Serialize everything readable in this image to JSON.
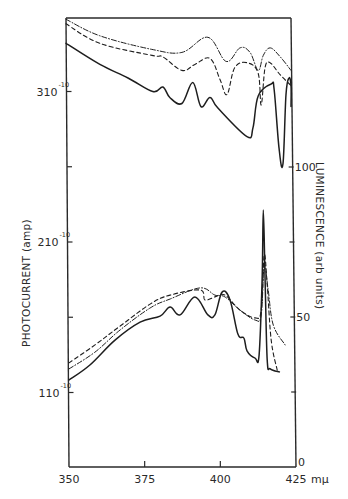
{
  "chart_data": {
    "type": "line",
    "title": "",
    "xlabel": "",
    "x_unit": "mμ",
    "ylabel_left": "PHOTOCURRENT (amp)",
    "ylabel_right": "LUMINESCENCE (arb units)",
    "xlim": [
      350,
      425
    ],
    "x_ticks": [
      {
        "value": 350,
        "label": "350"
      },
      {
        "value": 375,
        "label": "375"
      },
      {
        "value": 400,
        "label": "400"
      },
      {
        "value": 425,
        "label": "425"
      }
    ],
    "y_left_ticks": [
      {
        "value": 3.0,
        "mantissa": "3",
        "base": "10",
        "exp": "-10",
        "labeled": true
      },
      {
        "value": 2.5,
        "labeled": false
      },
      {
        "value": 2.0,
        "mantissa": "2",
        "base": "10",
        "exp": "-10",
        "labeled": true
      },
      {
        "value": 1.5,
        "labeled": false
      },
      {
        "value": 1.0,
        "mantissa": "1",
        "base": "10",
        "exp": "-10",
        "labeled": true
      }
    ],
    "y_left_unit_note": "values in units of 1e-10 A",
    "y_right_ticks": [
      {
        "value": 100,
        "label": "100"
      },
      {
        "value": 75,
        "label": ""
      },
      {
        "value": 50,
        "label": "50"
      },
      {
        "value": 25,
        "label": ""
      },
      {
        "value": 0,
        "label": "0"
      }
    ],
    "ylim_right": [
      0,
      100
    ],
    "grid": false,
    "legend": null,
    "series": [
      {
        "name": "photocurrent-solid",
        "axis": "left",
        "style": "solid",
        "x": [
          349.0,
          360.2,
          369.5,
          377.7,
          381.0,
          383.3,
          387.3,
          390.9,
          393.6,
          396.6,
          399.2,
          408.8,
          410.8,
          412.5,
          416.8,
          417.8,
          419.4,
          420.7,
          421.7,
          422.7,
          425.3,
          430.0
        ],
        "y": [
          3.32,
          3.18,
          3.09,
          3.0,
          3.03,
          2.96,
          2.92,
          3.06,
          2.9,
          2.96,
          2.89,
          2.7,
          2.76,
          2.97,
          3.05,
          3.01,
          2.62,
          2.52,
          2.98,
          3.09,
          3.04,
          2.9
        ]
      },
      {
        "name": "photocurrent-dashed",
        "axis": "left",
        "style": "dashed",
        "x": [
          349.0,
          360.2,
          377.4,
          381.0,
          387.3,
          391.6,
          396.6,
          399.9,
          402.2,
          404.8,
          409.1,
          412.5,
          413.5,
          414.8,
          416.5,
          419.8,
          423.4
        ],
        "y": [
          3.45,
          3.32,
          3.24,
          3.23,
          3.14,
          3.18,
          3.22,
          3.08,
          2.98,
          3.16,
          3.19,
          3.12,
          2.91,
          3.16,
          3.19,
          3.11,
          3.04
        ]
      },
      {
        "name": "photocurrent-dashdot",
        "axis": "left",
        "style": "dashdot",
        "x": [
          349.0,
          360.2,
          377.4,
          387.3,
          395.9,
          401.9,
          406.5,
          409.8,
          412.5,
          414.2,
          416.5,
          419.8,
          423.4
        ],
        "y": [
          3.48,
          3.37,
          3.28,
          3.26,
          3.36,
          3.2,
          3.29,
          3.26,
          3.14,
          3.24,
          3.29,
          3.23,
          3.14
        ]
      },
      {
        "name": "luminescence-solid",
        "axis": "right",
        "style": "solid",
        "x": [
          350.0,
          356.9,
          365.2,
          373.5,
          380.1,
          383.4,
          386.7,
          391.6,
          395.9,
          398.2,
          400.6,
          403.2,
          405.8,
          407.8,
          408.8,
          411.5,
          412.8,
          413.8,
          414.2,
          414.8,
          415.5,
          416.5,
          419.5
        ],
        "y": [
          29.0,
          34.0,
          42.3,
          48.3,
          50.3,
          53.3,
          50.7,
          56.7,
          50.7,
          50.7,
          58.3,
          55.7,
          44.3,
          43.0,
          38.7,
          36.3,
          37.3,
          62.3,
          85.7,
          62.3,
          35.7,
          32.7,
          31.7
        ]
      },
      {
        "name": "luminescence-dashed",
        "axis": "right",
        "style": "dashed",
        "x": [
          350.0,
          358.6,
          366.9,
          376.8,
          383.4,
          393.3,
          394.9,
          398.2,
          401.5,
          406.5,
          411.5,
          413.5,
          414.5,
          415.5,
          416.8,
          418.8
        ],
        "y": [
          34.7,
          40.7,
          47.0,
          54.3,
          57.3,
          59.0,
          55.7,
          56.7,
          57.3,
          52.3,
          49.7,
          52.3,
          70.7,
          60.7,
          42.3,
          32.3
        ]
      },
      {
        "name": "luminescence-dashdot",
        "axis": "right",
        "style": "dashdot",
        "x": [
          350.0,
          358.6,
          366.9,
          376.8,
          383.4,
          393.3,
          398.2,
          401.5,
          406.5,
          411.5,
          413.5,
          414.5,
          415.8,
          417.5,
          421.4
        ],
        "y": [
          32.7,
          38.3,
          45.7,
          53.0,
          56.0,
          59.7,
          57.3,
          56.7,
          52.3,
          49.0,
          50.7,
          67.3,
          59.0,
          47.3,
          40.7
        ]
      }
    ]
  }
}
